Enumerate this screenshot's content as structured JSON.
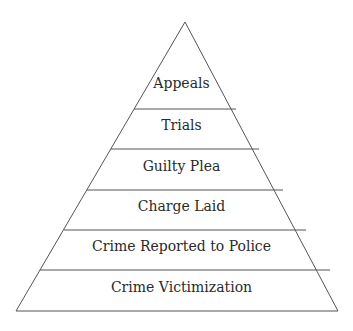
{
  "diagram": {
    "type": "pyramid",
    "levels_top_to_bottom": [
      {
        "label": "Appeals"
      },
      {
        "label": "Trials"
      },
      {
        "label": "Guilty Plea"
      },
      {
        "label": "Charge Laid"
      },
      {
        "label": "Crime Reported to Police"
      },
      {
        "label": "Crime Victimization"
      }
    ],
    "colors": {
      "line": "#555555",
      "text": "#2a2a2a",
      "background": "#ffffff"
    }
  }
}
